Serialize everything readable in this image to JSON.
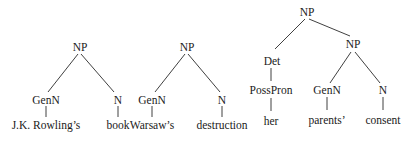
{
  "trees": [
    {
      "id": "tree-1",
      "root": "NP",
      "nodes": {
        "root": "NP",
        "left": "GenN",
        "right": "N",
        "left_leaf": "J.K. Rowling’s",
        "right_leaf": "book"
      }
    },
    {
      "id": "tree-2",
      "root": "NP",
      "nodes": {
        "root": "NP",
        "left": "GenN",
        "right": "N",
        "left_leaf": "Warsaw’s",
        "right_leaf": "destruction"
      }
    },
    {
      "id": "tree-3",
      "root": "NP",
      "nodes": {
        "root": "NP",
        "det": "Det",
        "poss": "PossPron",
        "det_leaf": "her",
        "inner_np": "NP",
        "inner_left": "GenN",
        "inner_right": "N",
        "inner_left_leaf": "parents’",
        "inner_right_leaf": "consent"
      }
    }
  ]
}
